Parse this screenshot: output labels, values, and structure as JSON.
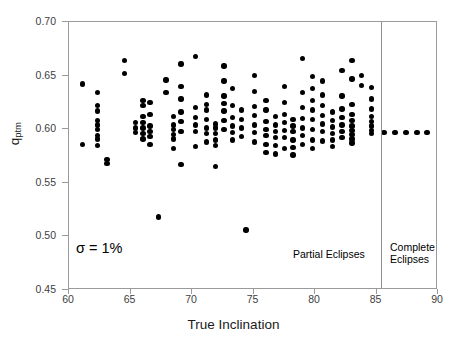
{
  "chart_data": {
    "type": "scatter",
    "title": "",
    "xlabel": "True Inclination",
    "ylabel": "q_ptm",
    "ylabel_base": "q",
    "ylabel_sub": "ptm",
    "xlim": [
      60,
      90
    ],
    "ylim": [
      0.45,
      0.7
    ],
    "xticks": [
      60,
      65,
      70,
      75,
      80,
      85,
      90
    ],
    "yticks": [
      0.45,
      0.5,
      0.55,
      0.6,
      0.65,
      0.7
    ],
    "xtick_labels": [
      "60",
      "65",
      "70",
      "75",
      "80",
      "85",
      "90"
    ],
    "ytick_labels": [
      "0.45",
      "0.50",
      "0.55",
      "0.60",
      "0.65",
      "0.70"
    ],
    "grid": false,
    "legend": "none",
    "marker_color": "#000000",
    "frame_color": "#9a9a9a",
    "annotations": [
      {
        "name": "sigma-note",
        "text": "σ = 1%",
        "x": 61.3,
        "y": 0.487
      },
      {
        "name": "partial-eclipses-label",
        "text": "Partial Eclipses",
        "x": 79.5,
        "y": 0.4745
      },
      {
        "name": "complete-eclipses-label-line1",
        "text": "Complete",
        "x": 87.2,
        "y": 0.479
      },
      {
        "name": "complete-eclipses-label-line2",
        "text": "Eclipses",
        "x": 87.2,
        "y": 0.468
      }
    ],
    "divider_x": 85.4,
    "points": [
      [
        61.1,
        0.642
      ],
      [
        61.1,
        0.586
      ],
      [
        62.3,
        0.634
      ],
      [
        62.3,
        0.622
      ],
      [
        62.3,
        0.617
      ],
      [
        62.3,
        0.608
      ],
      [
        62.3,
        0.604
      ],
      [
        62.3,
        0.6
      ],
      [
        62.3,
        0.594
      ],
      [
        62.3,
        0.591
      ],
      [
        62.3,
        0.585
      ],
      [
        63.1,
        0.572
      ],
      [
        63.1,
        0.568
      ],
      [
        64.5,
        0.664
      ],
      [
        64.5,
        0.652
      ],
      [
        65.4,
        0.606
      ],
      [
        65.4,
        0.601
      ],
      [
        65.4,
        0.597
      ],
      [
        66.0,
        0.627
      ],
      [
        66.0,
        0.622
      ],
      [
        66.0,
        0.612
      ],
      [
        66.0,
        0.606
      ],
      [
        66.0,
        0.601
      ],
      [
        66.0,
        0.596
      ],
      [
        66.0,
        0.591
      ],
      [
        66.6,
        0.625
      ],
      [
        66.6,
        0.614
      ],
      [
        66.6,
        0.603
      ],
      [
        66.6,
        0.598
      ],
      [
        66.6,
        0.593
      ],
      [
        66.6,
        0.586
      ],
      [
        67.3,
        0.518
      ],
      [
        67.9,
        0.646
      ],
      [
        67.9,
        0.634
      ],
      [
        68.5,
        0.612
      ],
      [
        68.5,
        0.604
      ],
      [
        68.5,
        0.6
      ],
      [
        68.5,
        0.595
      ],
      [
        68.5,
        0.591
      ],
      [
        68.5,
        0.582
      ],
      [
        69.1,
        0.661
      ],
      [
        69.1,
        0.64
      ],
      [
        69.1,
        0.628
      ],
      [
        69.1,
        0.616
      ],
      [
        69.1,
        0.607
      ],
      [
        69.1,
        0.598
      ],
      [
        69.1,
        0.567
      ],
      [
        70.3,
        0.668
      ],
      [
        70.3,
        0.62
      ],
      [
        70.3,
        0.611
      ],
      [
        70.3,
        0.604
      ],
      [
        70.3,
        0.598
      ],
      [
        70.3,
        0.584
      ],
      [
        71.2,
        0.632
      ],
      [
        71.2,
        0.623
      ],
      [
        71.2,
        0.618
      ],
      [
        71.2,
        0.609
      ],
      [
        71.2,
        0.601
      ],
      [
        71.2,
        0.596
      ],
      [
        71.2,
        0.588
      ],
      [
        71.9,
        0.605
      ],
      [
        71.9,
        0.601
      ],
      [
        71.9,
        0.596
      ],
      [
        71.9,
        0.59
      ],
      [
        71.9,
        0.585
      ],
      [
        71.9,
        0.565
      ],
      [
        72.6,
        0.659
      ],
      [
        72.6,
        0.645
      ],
      [
        72.6,
        0.631
      ],
      [
        72.6,
        0.624
      ],
      [
        72.6,
        0.617
      ],
      [
        72.6,
        0.608
      ],
      [
        72.6,
        0.6
      ],
      [
        73.3,
        0.638
      ],
      [
        73.3,
        0.622
      ],
      [
        73.3,
        0.611
      ],
      [
        73.3,
        0.603
      ],
      [
        73.3,
        0.597
      ],
      [
        73.3,
        0.59
      ],
      [
        74.0,
        0.618
      ],
      [
        74.0,
        0.609
      ],
      [
        74.0,
        0.601
      ],
      [
        74.0,
        0.593
      ],
      [
        74.4,
        0.506
      ],
      [
        75.1,
        0.65
      ],
      [
        75.1,
        0.635
      ],
      [
        75.1,
        0.621
      ],
      [
        75.1,
        0.613
      ],
      [
        75.1,
        0.604
      ],
      [
        75.1,
        0.597
      ],
      [
        75.1,
        0.588
      ],
      [
        76.0,
        0.627
      ],
      [
        76.0,
        0.618
      ],
      [
        76.0,
        0.607
      ],
      [
        76.0,
        0.6
      ],
      [
        76.0,
        0.594
      ],
      [
        76.0,
        0.586
      ],
      [
        76.0,
        0.578
      ],
      [
        76.8,
        0.612
      ],
      [
        76.8,
        0.604
      ],
      [
        76.8,
        0.598
      ],
      [
        76.8,
        0.592
      ],
      [
        76.8,
        0.585
      ],
      [
        76.8,
        0.577
      ],
      [
        77.5,
        0.64
      ],
      [
        77.5,
        0.625
      ],
      [
        77.5,
        0.614
      ],
      [
        77.5,
        0.606
      ],
      [
        77.5,
        0.599
      ],
      [
        77.5,
        0.592
      ],
      [
        77.5,
        0.582
      ],
      [
        78.2,
        0.609
      ],
      [
        78.2,
        0.603
      ],
      [
        78.2,
        0.598
      ],
      [
        78.2,
        0.59
      ],
      [
        78.2,
        0.583
      ],
      [
        78.2,
        0.576
      ],
      [
        79.0,
        0.666
      ],
      [
        79.0,
        0.634
      ],
      [
        79.0,
        0.62
      ],
      [
        79.0,
        0.61
      ],
      [
        79.0,
        0.601
      ],
      [
        79.0,
        0.594
      ],
      [
        79.0,
        0.586
      ],
      [
        79.8,
        0.649
      ],
      [
        79.8,
        0.638
      ],
      [
        79.8,
        0.627
      ],
      [
        79.8,
        0.618
      ],
      [
        79.8,
        0.609
      ],
      [
        79.8,
        0.6
      ],
      [
        79.8,
        0.59
      ],
      [
        79.8,
        0.582
      ],
      [
        80.6,
        0.645
      ],
      [
        80.6,
        0.632
      ],
      [
        80.6,
        0.622
      ],
      [
        80.6,
        0.613
      ],
      [
        80.6,
        0.605
      ],
      [
        80.6,
        0.598
      ],
      [
        80.6,
        0.589
      ],
      [
        81.4,
        0.616
      ],
      [
        81.4,
        0.608
      ],
      [
        81.4,
        0.602
      ],
      [
        81.4,
        0.596
      ],
      [
        81.4,
        0.59
      ],
      [
        81.4,
        0.584
      ],
      [
        82.2,
        0.655
      ],
      [
        82.2,
        0.631
      ],
      [
        82.2,
        0.619
      ],
      [
        82.2,
        0.611
      ],
      [
        82.2,
        0.604
      ],
      [
        82.2,
        0.598
      ],
      [
        82.2,
        0.592
      ],
      [
        83.0,
        0.664
      ],
      [
        83.0,
        0.647
      ],
      [
        83.0,
        0.623
      ],
      [
        83.0,
        0.614
      ],
      [
        83.0,
        0.608
      ],
      [
        83.0,
        0.603
      ],
      [
        83.0,
        0.599
      ],
      [
        83.0,
        0.595
      ],
      [
        83.0,
        0.591
      ],
      [
        83.0,
        0.587
      ],
      [
        83.8,
        0.65
      ],
      [
        83.8,
        0.641
      ],
      [
        84.6,
        0.639
      ],
      [
        84.6,
        0.628
      ],
      [
        84.6,
        0.619
      ],
      [
        84.6,
        0.612
      ],
      [
        84.6,
        0.607
      ],
      [
        84.6,
        0.603
      ],
      [
        84.6,
        0.599
      ],
      [
        84.6,
        0.596
      ],
      [
        85.6,
        0.597
      ],
      [
        86.5,
        0.597
      ],
      [
        87.4,
        0.597
      ],
      [
        88.3,
        0.597
      ],
      [
        89.1,
        0.597
      ]
    ]
  }
}
